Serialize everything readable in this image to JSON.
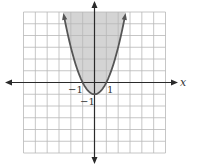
{
  "chart_data": {
    "type": "line",
    "title": "",
    "equation": "y = x^2 - 1",
    "inequality_region": "above curve (y > x^2 - 1)",
    "xlabel": "x",
    "ylabel": "",
    "xlim": [
      -6,
      6
    ],
    "ylim": [
      -6,
      6
    ],
    "grid": true,
    "grid_step": 1,
    "tick_labels": {
      "x": [
        {
          "value": -1,
          "label": "−1"
        },
        {
          "value": 1,
          "label": "1"
        }
      ],
      "y": [
        {
          "value": -1,
          "label": "−1"
        }
      ]
    },
    "series": [
      {
        "name": "parabola",
        "x": [
          -2.55,
          -2,
          -1.5,
          -1,
          -0.5,
          0,
          0.5,
          1,
          1.5,
          2,
          2.55
        ],
        "y": [
          5.5,
          3,
          1.25,
          0,
          -0.75,
          -1,
          -0.75,
          0,
          1.25,
          3,
          5.5
        ],
        "shaded": true
      }
    ],
    "colors": {
      "grid": "#b8b8b8",
      "axis": "#2a2a2a",
      "curve": "#555555",
      "shade": "#d4d4d4"
    }
  },
  "labels": {
    "x_axis": "x",
    "tick_neg1_x": "−1",
    "tick_pos1_x": "1",
    "tick_neg1_y": "−1"
  }
}
